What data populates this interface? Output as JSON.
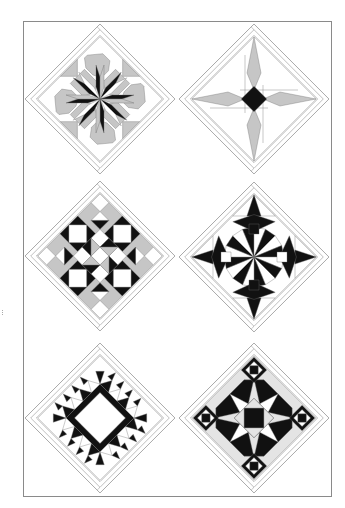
{
  "page": {
    "background": "#ffffff"
  },
  "colors": {
    "black": "#111111",
    "dark": "#1e1e1e",
    "grey": "#c6c6c6",
    "light_grey": "#e4e4e4",
    "white": "#ffffff",
    "line": "#8a8a8a"
  },
  "blocks": [
    {
      "id": "block-1",
      "position": "top-left",
      "pattern": "eight-point-star-with-grey-octagons",
      "colors_used": [
        "black",
        "grey",
        "white"
      ]
    },
    {
      "id": "block-2",
      "position": "top-right",
      "pattern": "four-point-star-with-black-center",
      "colors_used": [
        "black",
        "grey",
        "white"
      ]
    },
    {
      "id": "block-3",
      "position": "middle-left",
      "pattern": "nine-patch-with-square-in-square",
      "colors_used": [
        "black",
        "grey",
        "white"
      ]
    },
    {
      "id": "block-4",
      "position": "middle-right",
      "pattern": "mariners-compass-star",
      "colors_used": [
        "black",
        "white"
      ]
    },
    {
      "id": "block-5",
      "position": "bottom-left",
      "pattern": "sawtooth-star-ring",
      "colors_used": [
        "black",
        "white"
      ]
    },
    {
      "id": "block-6",
      "position": "bottom-right",
      "pattern": "storm-at-sea",
      "colors_used": [
        "black",
        "light_grey",
        "white"
      ]
    }
  ]
}
